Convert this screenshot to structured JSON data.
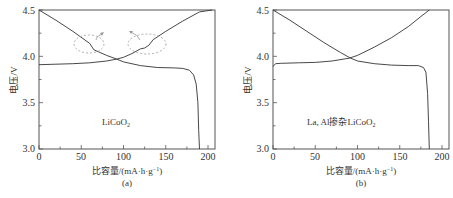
{
  "chart_data": [
    {
      "type": "line",
      "panel_label": "(a)",
      "annotation": "LiCoO2",
      "xlabel": "比容量/(mA·h·g⁻¹)",
      "ylabel": "电压/V",
      "xlim": [
        0,
        210
      ],
      "ylim": [
        3.0,
        4.5
      ],
      "xticks": [
        0,
        50,
        100,
        150,
        200
      ],
      "yticks": [
        3.0,
        3.5,
        4.0,
        4.5
      ],
      "grid": false,
      "series": [
        {
          "name": "charge",
          "x": [
            0,
            20,
            40,
            60,
            80,
            92,
            100,
            110,
            120,
            125,
            130,
            135,
            150,
            170,
            190,
            205
          ],
          "y": [
            3.91,
            3.915,
            3.92,
            3.93,
            3.95,
            3.97,
            3.99,
            4.03,
            4.08,
            4.09,
            4.12,
            4.18,
            4.27,
            4.38,
            4.48,
            4.5
          ]
        },
        {
          "name": "discharge",
          "x": [
            0,
            20,
            40,
            60,
            65,
            70,
            80,
            92,
            100,
            120,
            140,
            160,
            170,
            178,
            183,
            186,
            188,
            189,
            190
          ],
          "y": [
            4.5,
            4.39,
            4.27,
            4.14,
            4.07,
            4.05,
            4.01,
            3.97,
            3.94,
            3.9,
            3.88,
            3.875,
            3.87,
            3.85,
            3.8,
            3.7,
            3.5,
            3.2,
            3.0
          ]
        }
      ],
      "highlights": [
        {
          "shape": "dashed-ellipse",
          "center_x": 60,
          "center_y": 4.14
        },
        {
          "shape": "dashed-ellipse",
          "center_x": 125,
          "center_y": 4.12
        }
      ]
    },
    {
      "type": "line",
      "panel_label": "(b)",
      "annotation": "La, Al掺杂LiCoO2",
      "xlabel": "比容量/(mA·h·g⁻¹)",
      "ylabel": "电压/V",
      "xlim": [
        0,
        210
      ],
      "ylim": [
        3.0,
        4.5
      ],
      "xticks": [
        0,
        50,
        100,
        150,
        200
      ],
      "yticks": [
        3.0,
        3.5,
        4.0,
        4.5
      ],
      "grid": false,
      "series": [
        {
          "name": "charge",
          "x": [
            0,
            3,
            10,
            30,
            50,
            70,
            90,
            100,
            120,
            140,
            160,
            175,
            185
          ],
          "y": [
            3.89,
            3.92,
            3.925,
            3.93,
            3.935,
            3.95,
            3.98,
            4.01,
            4.1,
            4.2,
            4.32,
            4.43,
            4.5
          ]
        },
        {
          "name": "discharge",
          "x": [
            0,
            20,
            40,
            60,
            80,
            92,
            100,
            120,
            140,
            160,
            172,
            178,
            181,
            183,
            184,
            185
          ],
          "y": [
            4.5,
            4.39,
            4.27,
            4.15,
            4.04,
            3.98,
            3.95,
            3.92,
            3.905,
            3.9,
            3.9,
            3.88,
            3.83,
            3.6,
            3.3,
            3.0
          ]
        }
      ]
    }
  ],
  "panels": {
    "a": {
      "y_label": "电压/V",
      "x_label": "比容量/(mA·h·g",
      "x_label_sup": "−1",
      "x_label_end": ")",
      "panel_label": "(a)",
      "annotation_main": "LiCoO",
      "annotation_sub": "2",
      "y_ticks": [
        "4.5",
        "4.0",
        "3.5",
        "3.0"
      ],
      "x_ticks": [
        "0",
        "50",
        "100",
        "150",
        "200"
      ]
    },
    "b": {
      "y_label": "电压/V",
      "x_label": "比容量/(mA·h·g",
      "x_label_sup": "−1",
      "x_label_end": ")",
      "panel_label": "(b)",
      "annotation_main": "La, Al掺杂LiCoO",
      "annotation_sub": "2",
      "y_ticks": [
        "4.5",
        "4.0",
        "3.5",
        "3.0"
      ],
      "x_ticks": [
        "0",
        "50",
        "100",
        "150",
        "200"
      ]
    }
  },
  "colors": {
    "line": "#333333",
    "highlight": "#9a9a9a"
  }
}
